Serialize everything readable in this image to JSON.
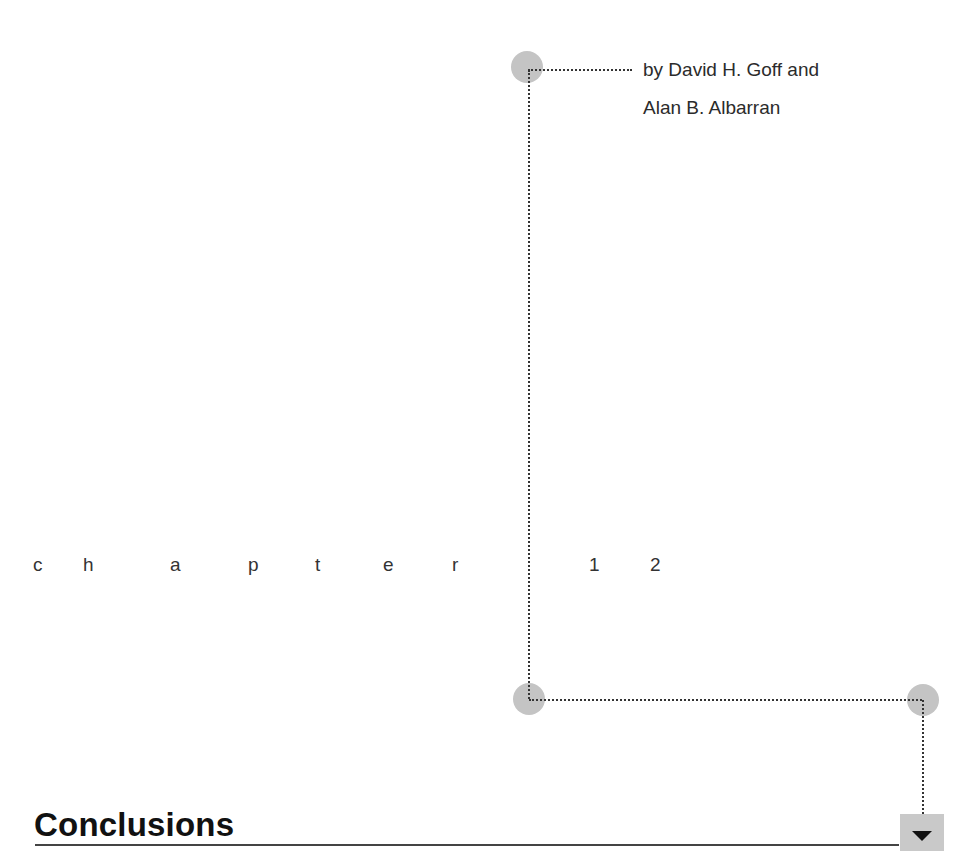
{
  "byline": {
    "line1": "by David H. Goff and",
    "line2": "Alan B. Albarran"
  },
  "chapter": {
    "letters": [
      "c",
      "h",
      "a",
      "p",
      "t",
      "e",
      "r"
    ],
    "number_digits": [
      "1",
      "2"
    ]
  },
  "heading": {
    "title": "Conclusions"
  },
  "colors": {
    "circle": "#c4c4c4",
    "dotted_line": "#333333",
    "rule": "#444444",
    "nav_box": "#c9c9c9"
  },
  "icons": {
    "nav": "down-triangle-icon"
  }
}
